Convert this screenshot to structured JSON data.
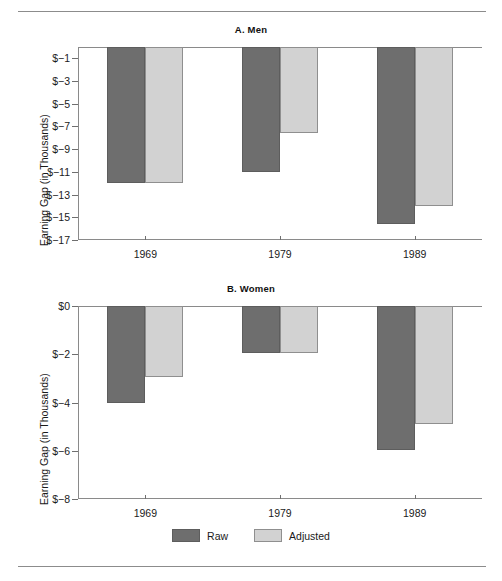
{
  "figure": {
    "background": "#ffffff",
    "rule_color": "#8c8c8c"
  },
  "colors": {
    "raw": "#6e6e6e",
    "adjusted": "#d2d2d2",
    "axis": "#8a8a8a",
    "text": "#1a1a1a"
  },
  "legend": {
    "items": [
      {
        "label": "Raw",
        "series": "raw"
      },
      {
        "label": "Adjusted",
        "series": "adjusted"
      }
    ]
  },
  "panels": [
    {
      "id": "men",
      "title": "A. Men",
      "ylabel": "Earning Gap (in Thousands)",
      "ytick_labels": [
        "$−1",
        "$−3",
        "$−5",
        "$−7",
        "$−9",
        "$−11",
        "$−13",
        "$−15",
        "$−17"
      ],
      "ytick_values": [
        -1,
        -3,
        -5,
        -7,
        -9,
        -11,
        -13,
        -15,
        -17
      ],
      "xtick_labels": [
        "1969",
        "1979",
        "1989"
      ]
    },
    {
      "id": "women",
      "title": "B. Women",
      "ylabel": "Earning Gap (in Thousands)",
      "ytick_labels": [
        "$0",
        "$−2",
        "$−4",
        "$−6",
        "$−8"
      ],
      "ytick_values": [
        0,
        -2,
        -4,
        -6,
        -8
      ],
      "xtick_labels": [
        "1969",
        "1979",
        "1989"
      ]
    }
  ],
  "chart_data": [
    {
      "type": "bar",
      "title": "A. Men",
      "xlabel": "",
      "ylabel": "Earning Gap (in Thousands)",
      "categories": [
        "1969",
        "1979",
        "1989"
      ],
      "series": [
        {
          "name": "Raw",
          "values": [
            -12.0,
            -11.0,
            -15.6
          ]
        },
        {
          "name": "Adjusted",
          "values": [
            -12.0,
            -7.6,
            -14.0
          ]
        }
      ],
      "ylim": [
        -17,
        0
      ],
      "yticks": [
        -1,
        -3,
        -5,
        -7,
        -9,
        -11,
        -13,
        -15,
        -17
      ],
      "ytick_labels": [
        "$−1",
        "$−3",
        "$−5",
        "$−7",
        "$−9",
        "$−11",
        "$−13",
        "$−15",
        "$−17"
      ],
      "grid": false,
      "legend_position": "bottom",
      "units": "thousands of dollars"
    },
    {
      "type": "bar",
      "title": "B. Women",
      "xlabel": "",
      "ylabel": "Earning Gap (in Thousands)",
      "categories": [
        "1969",
        "1979",
        "1989"
      ],
      "series": [
        {
          "name": "Raw",
          "values": [
            -4.0,
            -1.95,
            -5.95
          ]
        },
        {
          "name": "Adjusted",
          "values": [
            -2.95,
            -1.95,
            -4.9
          ]
        }
      ],
      "ylim": [
        -8,
        0
      ],
      "yticks": [
        0,
        -2,
        -4,
        -6,
        -8
      ],
      "ytick_labels": [
        "$0",
        "$−2",
        "$−4",
        "$−6",
        "$−8"
      ],
      "grid": false,
      "legend_position": "bottom",
      "units": "thousands of dollars"
    }
  ]
}
